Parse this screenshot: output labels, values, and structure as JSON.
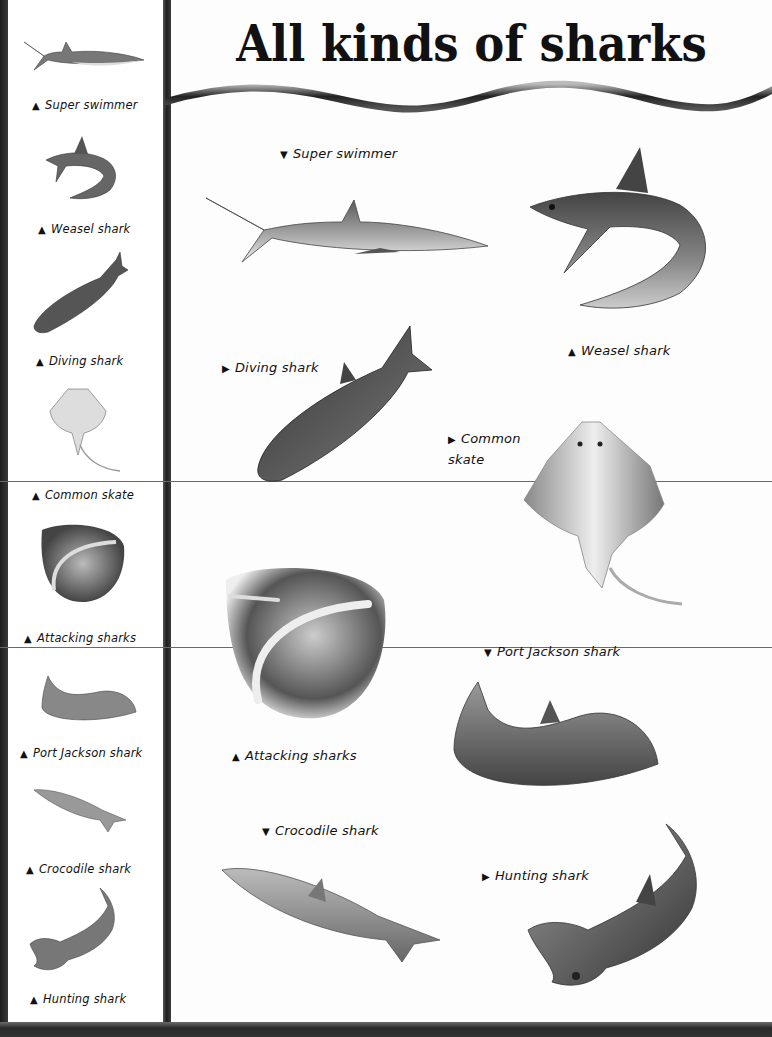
{
  "page": {
    "title": "All kinds of sharks",
    "colors": {
      "ink": "#111111",
      "paper": "#fdfdfd",
      "rule": "#6a6a6a",
      "spine": "#2a2a2a"
    }
  },
  "markers": {
    "up": "▲",
    "down": "▼",
    "right": "▶"
  },
  "sidebar": {
    "items": [
      {
        "label": "Super swimmer",
        "marker": "▲",
        "icon": "super-swimmer-shark"
      },
      {
        "label": "Weasel shark",
        "marker": "▲",
        "icon": "weasel-shark"
      },
      {
        "label": "Diving shark",
        "marker": "▲",
        "icon": "diving-shark"
      },
      {
        "label": "Common skate",
        "marker": "▲",
        "icon": "common-skate"
      },
      {
        "label": "Attacking sharks",
        "marker": "▲",
        "icon": "attacking-sharks"
      },
      {
        "label": "Port Jackson shark",
        "marker": "▲",
        "icon": "port-jackson-shark"
      },
      {
        "label": "Crocodile shark",
        "marker": "▲",
        "icon": "crocodile-shark"
      },
      {
        "label": "Hunting shark",
        "marker": "▲",
        "icon": "hunting-shark"
      }
    ]
  },
  "main": {
    "items": [
      {
        "label": "Super swimmer",
        "marker": "▼"
      },
      {
        "label": "Weasel shark",
        "marker": "▲"
      },
      {
        "label": "Diving shark",
        "marker": "▶"
      },
      {
        "label_line1": "Common",
        "label_line2": "skate",
        "marker": "▶"
      },
      {
        "label": "Port Jackson shark",
        "marker": "▼"
      },
      {
        "label": "Attacking sharks",
        "marker": "▲"
      },
      {
        "label": "Crocodile shark",
        "marker": "▼"
      },
      {
        "label": "Hunting shark",
        "marker": "▶"
      }
    ]
  }
}
